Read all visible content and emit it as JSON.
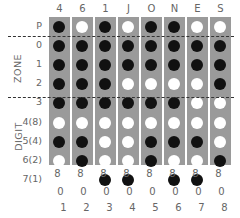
{
  "columns": [
    "4",
    "6",
    "1",
    "J",
    "O",
    "N",
    "E",
    "S"
  ],
  "zone_group_label": "ZONE",
  "digit_group_label": "DIGIT",
  "rows": [
    {
      "label": "P",
      "group": "parity",
      "holes": [
        1,
        0,
        1,
        0,
        1,
        1,
        0,
        0
      ]
    },
    {
      "label": "0",
      "group": "zone",
      "holes": [
        1,
        1,
        1,
        1,
        1,
        1,
        1,
        1
      ]
    },
    {
      "label": "1",
      "group": "zone",
      "holes": [
        1,
        1,
        1,
        1,
        1,
        1,
        1,
        1
      ]
    },
    {
      "label": "2",
      "group": "zone",
      "holes": [
        1,
        1,
        1,
        0,
        0,
        0,
        0,
        1
      ]
    },
    {
      "label": "3",
      "group": "zone",
      "holes": [
        1,
        1,
        1,
        1,
        1,
        1,
        0,
        0
      ]
    },
    {
      "label": "4(8)",
      "group": "digit",
      "holes": [
        0,
        0,
        0,
        0,
        0,
        0,
        0,
        0
      ]
    },
    {
      "label": "5(4)",
      "group": "digit",
      "holes": [
        1,
        1,
        0,
        0,
        1,
        1,
        1,
        0
      ]
    },
    {
      "label": "6(2)",
      "group": "digit",
      "holes": [
        0,
        1,
        0,
        0,
        1,
        0,
        0,
        1
      ]
    },
    {
      "label": "7(1)",
      "group": "digit",
      "holes": [
        0,
        0,
        1,
        1,
        0,
        1,
        1,
        0
      ]
    }
  ],
  "footer_rows": [
    [
      "8",
      "8",
      "8",
      "8",
      "8",
      "8",
      "8",
      "8"
    ],
    [
      "0",
      "0",
      "0",
      "0",
      "0",
      "0",
      "0",
      "0"
    ],
    [
      "1",
      "2",
      "3",
      "4",
      "5",
      "6",
      "7",
      "8"
    ]
  ],
  "legend": {
    "punched": "black hole",
    "open": "white hole"
  },
  "colors": {
    "card": "#9a9a9a",
    "punched": "#111111",
    "open": "#ffffff",
    "divider": "#333333"
  }
}
